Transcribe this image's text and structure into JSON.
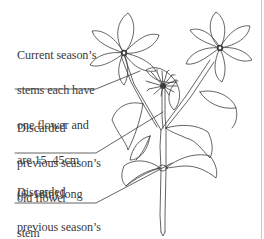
{
  "diagram": {
    "labels": [
      {
        "id": "current-stems",
        "lines": [
          "Current season’s",
          "stems each have",
          "one flower and",
          "are 15–45cm",
          "(6–18in) long"
        ]
      },
      {
        "id": "old-flower-stem",
        "lines": [
          "Discarded",
          "previous season’s",
          "old flower",
          "stem"
        ]
      },
      {
        "id": "old-leaves",
        "lines": [
          "Discarded",
          "previous season’s",
          "leaves"
        ]
      }
    ],
    "colors": {
      "line": "#3c3c3c",
      "text": "#3a3a3a",
      "background": "#ffffff",
      "border": "#c8c8c8"
    }
  }
}
